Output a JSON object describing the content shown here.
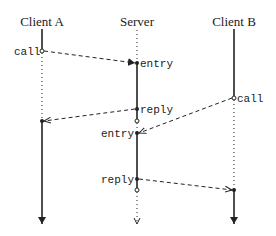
{
  "diagram": {
    "type": "sequence",
    "participants": [
      {
        "id": "clientA",
        "label": "Client A"
      },
      {
        "id": "server",
        "label": "Server"
      },
      {
        "id": "clientB",
        "label": "Client B"
      }
    ],
    "events": [
      {
        "participant": "clientA",
        "label": "call"
      },
      {
        "participant": "server",
        "label": "entry"
      },
      {
        "participant": "server",
        "label": "reply"
      },
      {
        "participant": "clientB",
        "label": "call"
      },
      {
        "participant": "server",
        "label": "entry"
      },
      {
        "participant": "server",
        "label": "reply"
      }
    ],
    "messages": [
      {
        "from": "clientA",
        "to": "server",
        "from_event": "call",
        "to_event": "entry"
      },
      {
        "from": "server",
        "to": "clientA",
        "from_event": "reply",
        "to_event": "resume"
      },
      {
        "from": "clientB",
        "to": "server",
        "from_event": "call",
        "to_event": "entry"
      },
      {
        "from": "server",
        "to": "clientB",
        "from_event": "reply",
        "to_event": "resume"
      }
    ],
    "colors": {
      "line": "#222222",
      "background": "#ffffff"
    }
  }
}
